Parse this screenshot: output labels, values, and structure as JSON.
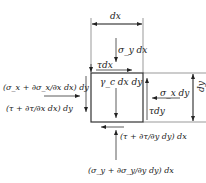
{
  "diagram": {
    "type": "free-body element stress diagram",
    "colors": {
      "line": "#222222",
      "background": "#ffffff"
    },
    "element": {
      "body_force_label": "γ꜀dxdy",
      "body_force_text": "γ_c dx dy"
    },
    "dimensions": {
      "width_label": "dx",
      "height_label": "dy"
    },
    "forces": {
      "top_normal": "σ_y dx",
      "top_shear": "τdx",
      "right_normal": "σ_x dy",
      "right_shear": "τdy",
      "left_normal": "(σ_x + ∂σ_x/∂x dx) dy",
      "left_shear": "(τ + ∂τ/∂x dx) dy",
      "bottom_shear": "(τ + ∂τ/∂y dy) dx",
      "bottom_normal": "(σ_y + ∂σ_y/∂y dy) dx"
    }
  }
}
